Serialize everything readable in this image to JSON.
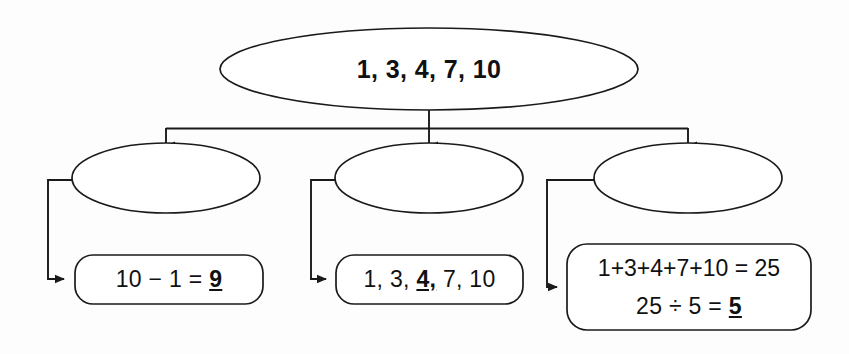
{
  "diagram": {
    "type": "tree-flowchart",
    "stroke_color": "#1a1a1a",
    "background_color": "#fdfdfd",
    "root": {
      "id": "root-ellipse",
      "shape": "ellipse",
      "text": "1, 3, 4, 7, 10"
    },
    "branches": [
      {
        "id": "branch-left",
        "ellipse": {
          "shape": "ellipse",
          "text": ""
        },
        "box": {
          "shape": "rounded-rect",
          "lines": [
            {
              "prefix": "10 − 1 = ",
              "emphasis": "9",
              "suffix": ""
            }
          ]
        }
      },
      {
        "id": "branch-middle",
        "ellipse": {
          "shape": "ellipse",
          "text": ""
        },
        "box": {
          "shape": "rounded-rect",
          "lines": [
            {
              "prefix": "1, 3, ",
              "emphasis": "4,",
              "suffix": " 7, 10"
            }
          ]
        }
      },
      {
        "id": "branch-right",
        "ellipse": {
          "shape": "ellipse",
          "text": ""
        },
        "box": {
          "shape": "rounded-rect",
          "lines": [
            {
              "prefix": "1+3+4+7+10 = 25",
              "emphasis": "",
              "suffix": ""
            },
            {
              "prefix": "25 ÷ 5 = ",
              "emphasis": "5",
              "suffix": ""
            }
          ]
        }
      }
    ],
    "connectors": {
      "root_stem": "vertical-line",
      "distribution_bar": "horizontal-line",
      "branch_arrows": "down-arrow",
      "ellipse_to_box": "elbow-arrow-right"
    }
  }
}
